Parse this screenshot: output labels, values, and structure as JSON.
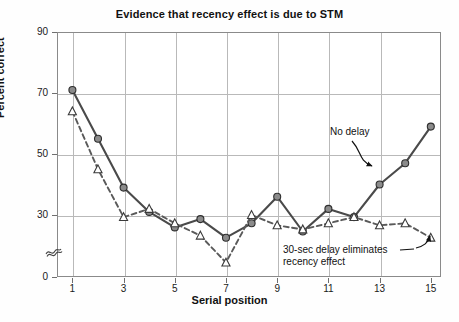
{
  "chart_data": {
    "type": "line",
    "title": "Evidence that recency effect is due to STM",
    "xlabel": "Serial position",
    "ylabel": "Percent correct",
    "x": [
      1,
      2,
      3,
      4,
      5,
      6,
      7,
      8,
      9,
      10,
      11,
      12,
      13,
      14,
      15
    ],
    "xticks": [
      1,
      3,
      5,
      7,
      9,
      11,
      13,
      15
    ],
    "yticks": [
      0,
      30,
      50,
      70,
      90
    ],
    "ylim": [
      0,
      90
    ],
    "xlim": [
      0.4,
      15.4
    ],
    "grid": true,
    "axis_break": true,
    "axis_break_between": [
      0,
      30
    ],
    "legend": "none",
    "series": [
      {
        "name": "No delay",
        "style": "solid",
        "marker": "filled-circle",
        "color": "#4a4a4a",
        "marker_fill": "#8b8b8b",
        "values": [
          71,
          55,
          39,
          31,
          24,
          28,
          19,
          26,
          36,
          22,
          32,
          29,
          40,
          47,
          59
        ]
      },
      {
        "name": "30-sec delay",
        "style": "dashed",
        "marker": "open-triangle",
        "color": "#5a5a5a",
        "marker_fill": "#ffffff",
        "values": [
          64,
          45,
          29,
          32,
          26,
          20,
          7,
          30,
          25,
          23,
          26,
          29,
          25,
          26,
          19
        ]
      }
    ],
    "annotations": [
      {
        "id": "no-delay",
        "text": "No delay",
        "points_to": "no-delay-series"
      },
      {
        "id": "delay",
        "text": "30-sec delay eliminates\nrecency effect",
        "points_to": "delay-series"
      }
    ]
  },
  "labels": {
    "annotation_no_delay": "No delay",
    "annotation_delay_line1": "30-sec delay eliminates",
    "annotation_delay_line2": "recency effect"
  },
  "colors": {
    "grid": "#b9b9b9",
    "frame": "#8a8a8a",
    "solid_line": "#3f3f3f",
    "dashed_line": "#5a5a5a",
    "marker_circle_fill": "#8b8b8b",
    "text": "#111111",
    "background": "#ffffff"
  }
}
